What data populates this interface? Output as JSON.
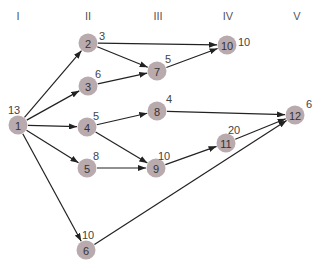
{
  "columns": [
    {
      "label": "I",
      "x": 18
    },
    {
      "label": "II",
      "x": 88
    },
    {
      "label": "III",
      "x": 158
    },
    {
      "label": "IV",
      "x": 228
    },
    {
      "label": "V",
      "x": 297
    }
  ],
  "node_color": "#b9aaae",
  "edge_color": "#222222",
  "nodes": [
    {
      "id": "1",
      "x": 18,
      "y": 125,
      "weight": "13",
      "wx": 8,
      "wy": 104
    },
    {
      "id": "2",
      "x": 88,
      "y": 43,
      "weight": "3",
      "wx": 99,
      "wy": 30
    },
    {
      "id": "3",
      "x": 88,
      "y": 86,
      "weight": "6",
      "wx": 95,
      "wy": 68
    },
    {
      "id": "4",
      "x": 87,
      "y": 127,
      "weight": "5",
      "wx": 93,
      "wy": 110
    },
    {
      "id": "5",
      "x": 87,
      "y": 168,
      "weight": "8",
      "wx": 93,
      "wy": 150
    },
    {
      "id": "6",
      "x": 86,
      "y": 250,
      "weight": "10",
      "wx": 82,
      "wy": 229
    },
    {
      "id": "7",
      "x": 157,
      "y": 71,
      "weight": "5",
      "wx": 165,
      "wy": 53
    },
    {
      "id": "8",
      "x": 157,
      "y": 111,
      "weight": "4",
      "wx": 166,
      "wy": 93
    },
    {
      "id": "9",
      "x": 156,
      "y": 168,
      "weight": "10",
      "wx": 158,
      "wy": 150
    },
    {
      "id": "10",
      "x": 227,
      "y": 45,
      "weight": "10",
      "wx": 238,
      "wy": 36
    },
    {
      "id": "11",
      "x": 226,
      "y": 143,
      "weight": "20",
      "wx": 228,
      "wy": 124
    },
    {
      "id": "12",
      "x": 295,
      "y": 115,
      "weight": "6",
      "wx": 306,
      "wy": 98
    }
  ],
  "edges": [
    [
      "1",
      "2"
    ],
    [
      "1",
      "3"
    ],
    [
      "1",
      "4"
    ],
    [
      "1",
      "5"
    ],
    [
      "1",
      "6"
    ],
    [
      "2",
      "10"
    ],
    [
      "2",
      "7"
    ],
    [
      "3",
      "7"
    ],
    [
      "7",
      "10"
    ],
    [
      "4",
      "8"
    ],
    [
      "4",
      "9"
    ],
    [
      "5",
      "9"
    ],
    [
      "8",
      "12"
    ],
    [
      "9",
      "11"
    ],
    [
      "11",
      "12"
    ],
    [
      "6",
      "12"
    ]
  ]
}
